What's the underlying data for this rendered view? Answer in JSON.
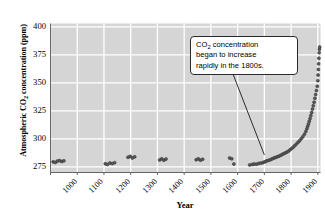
{
  "chart_data": {
    "type": "scatter",
    "title": "",
    "xlabel": "Year",
    "ylabel": "Atmospheric CO2 concentration (ppm)",
    "ylabel_rich": {
      "pre": "Atmospheric CO",
      "sub": "2",
      "post": " concentration (ppm)"
    },
    "xlim": [
      1000,
      2010
    ],
    "ylim": [
      270,
      403
    ],
    "yticks": [
      275,
      300,
      325,
      350,
      375,
      400
    ],
    "xticks": [
      1000,
      1100,
      1200,
      1300,
      1400,
      1500,
      1600,
      1700,
      1800,
      1900,
      2000
    ],
    "grid": true,
    "legend": "none",
    "plot_background": "#d5d5d5",
    "gridline_color": "#ffffff",
    "marker_color": "#4a4a4a",
    "annotations": [
      {
        "text": "CO2 concentration began to increase rapidly in the 1800s.",
        "text_lines": [
          "CO2 concentration",
          "began to increase",
          "rapidly in the 1800s."
        ],
        "rich": {
          "pre": "CO",
          "sub": "2",
          "post": " concentration"
        },
        "line2": "began to increase",
        "line3": "rapidly in the 1800s.",
        "points_to_year": 1800,
        "points_to_value": 283
      }
    ],
    "series": [
      {
        "name": "Ice core + modern CO2 record",
        "points": [
          [
            1010,
            279.5
          ],
          [
            1018,
            279.0
          ],
          [
            1026,
            280.2
          ],
          [
            1034,
            280.6
          ],
          [
            1042,
            279.8
          ],
          [
            1050,
            280.4
          ],
          [
            1205,
            277.8
          ],
          [
            1213,
            277.2
          ],
          [
            1222,
            278.4
          ],
          [
            1231,
            278.0
          ],
          [
            1240,
            278.8
          ],
          [
            1290,
            283.6
          ],
          [
            1298,
            284.4
          ],
          [
            1306,
            283.0
          ],
          [
            1315,
            284.0
          ],
          [
            1408,
            281.2
          ],
          [
            1416,
            282.2
          ],
          [
            1424,
            281.0
          ],
          [
            1432,
            282.0
          ],
          [
            1545,
            281.4
          ],
          [
            1553,
            282.2
          ],
          [
            1561,
            281.0
          ],
          [
            1569,
            281.8
          ],
          [
            1670,
            283.0
          ],
          [
            1678,
            282.2
          ],
          [
            1686,
            277.6
          ],
          [
            1745,
            276.8
          ],
          [
            1755,
            277.2
          ],
          [
            1762,
            277.6
          ],
          [
            1770,
            277.4
          ],
          [
            1778,
            278.0
          ],
          [
            1786,
            278.4
          ],
          [
            1794,
            278.8
          ],
          [
            1800,
            279.4
          ],
          [
            1806,
            280.0
          ],
          [
            1812,
            280.6
          ],
          [
            1818,
            281.0
          ],
          [
            1824,
            281.6
          ],
          [
            1830,
            282.2
          ],
          [
            1836,
            283.0
          ],
          [
            1842,
            283.4
          ],
          [
            1848,
            284.0
          ],
          [
            1854,
            284.6
          ],
          [
            1860,
            285.2
          ],
          [
            1866,
            286.0
          ],
          [
            1872,
            286.8
          ],
          [
            1878,
            287.4
          ],
          [
            1884,
            288.2
          ],
          [
            1890,
            289.0
          ],
          [
            1896,
            290.2
          ],
          [
            1902,
            291.4
          ],
          [
            1908,
            292.6
          ],
          [
            1914,
            294.0
          ],
          [
            1920,
            295.4
          ],
          [
            1926,
            297.0
          ],
          [
            1932,
            298.4
          ],
          [
            1938,
            300.2
          ],
          [
            1944,
            302.0
          ],
          [
            1950,
            304.2
          ],
          [
            1955,
            306.6
          ],
          [
            1959,
            309.0
          ],
          [
            1962,
            311.2
          ],
          [
            1965,
            313.4
          ],
          [
            1968,
            315.8
          ],
          [
            1971,
            318.2
          ],
          [
            1974,
            320.8
          ],
          [
            1977,
            323.6
          ],
          [
            1980,
            326.6
          ],
          [
            1983,
            329.6
          ],
          [
            1986,
            332.8
          ],
          [
            1989,
            336.2
          ],
          [
            1992,
            339.6
          ],
          [
            1995,
            343.2
          ],
          [
            1998,
            347.0
          ],
          [
            2000,
            352.0
          ],
          [
            2001,
            357.0
          ],
          [
            2002,
            362.0
          ],
          [
            2003,
            367.0
          ],
          [
            2004,
            372.0
          ],
          [
            2005,
            377.0
          ],
          [
            2006,
            380.0
          ],
          [
            2007,
            382.0
          ]
        ]
      }
    ]
  }
}
